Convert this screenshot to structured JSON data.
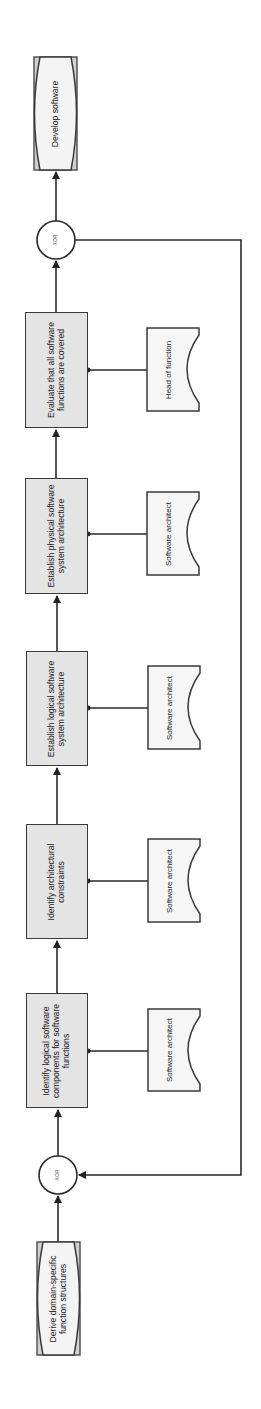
{
  "diagram": {
    "type": "EPC process chain",
    "orientation": "rotated 90 degrees counter-clockwise",
    "colors": {
      "function_fill": "#e4e4e4",
      "event_fill": "#f4f4f4",
      "role_fill": "#f6f6f6",
      "stroke": "#3a3a3a",
      "background": "#ffffff"
    },
    "start_event": {
      "label": "Derive domain-specific function structures"
    },
    "xor_join": {
      "label": "XOR"
    },
    "functions": [
      {
        "label": "Identify logical software components for software functions",
        "role": "Software architect"
      },
      {
        "label": "Identify architectural constraints",
        "role": "Software architect"
      },
      {
        "label": "Establish logical software system architecture",
        "role": "Software architect"
      },
      {
        "label": "Establish physical software system architecture",
        "role": "Software architect"
      },
      {
        "label": "Evaluate that all software functions are covered",
        "role": "Head of function"
      }
    ],
    "xor_split": {
      "label": "XOR"
    },
    "end_event": {
      "label": "Develop software"
    }
  }
}
